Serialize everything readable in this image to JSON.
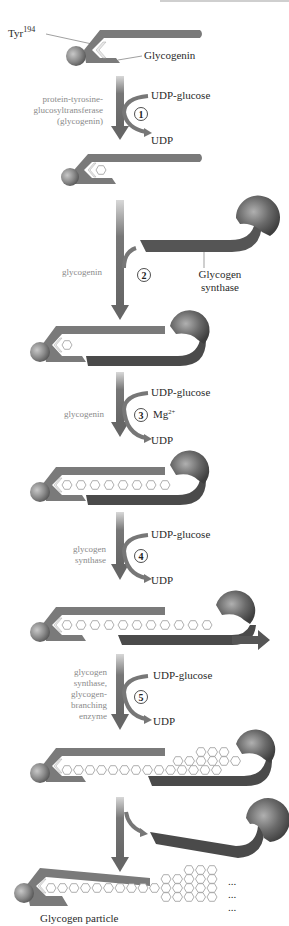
{
  "labels": {
    "tyr": "Tyr",
    "tyr_sup": "194",
    "glycogenin": "Glycogenin",
    "glycogen_synthase_line1": "Glycogen",
    "glycogen_synthase_line2": "synthase",
    "glycogen_particle": "Glycogen particle",
    "ellipsis": "..."
  },
  "steps": [
    {
      "number": "1",
      "enzyme_lines": [
        "protein-tyrosine-",
        "glucosyltransferase",
        "(glycogenin)"
      ],
      "substrate": "UDP-glucose",
      "product": "UDP",
      "cofactor": ""
    },
    {
      "number": "2",
      "enzyme_lines": [
        "glycogenin"
      ],
      "substrate": "",
      "product": "",
      "cofactor": ""
    },
    {
      "number": "3",
      "enzyme_lines": [
        "glycogenin"
      ],
      "substrate": "UDP-glucose",
      "product": "UDP",
      "cofactor": "Mg",
      "cofactor_sup": "2+"
    },
    {
      "number": "4",
      "enzyme_lines": [
        "glycogen",
        "synthase"
      ],
      "substrate": "UDP-glucose",
      "product": "UDP",
      "cofactor": ""
    },
    {
      "number": "5",
      "enzyme_lines": [
        "glycogen",
        "synthase,",
        "glycogen-",
        "branching",
        "enzyme"
      ],
      "substrate": "UDP-glucose",
      "product": "UDP",
      "cofactor": ""
    }
  ],
  "colors": {
    "glycogenin_body": "#7a7a7a",
    "synthase_body": "#555555",
    "arrow": "#6e6e6e",
    "glucose_ring": "#9a9a9a",
    "enzyme_text": "#8a8a8a",
    "label_text": "#2a2a2a"
  }
}
